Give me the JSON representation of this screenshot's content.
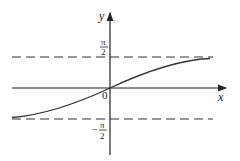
{
  "diagram": {
    "function": "y = arctan x",
    "axes": {
      "x_label": "x",
      "y_label": "y",
      "origin_label": "0"
    },
    "asymptotes": {
      "upper": {
        "num": "π",
        "den": "2",
        "sign": ""
      },
      "lower": {
        "num": "π",
        "den": "2",
        "sign": "−"
      }
    },
    "colors": {
      "axis": "#222222",
      "curve": "#333333",
      "dashed": "#333333"
    }
  }
}
